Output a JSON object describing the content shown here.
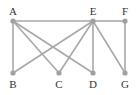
{
  "graph": {
    "nodes": [
      {
        "id": "A",
        "label": "A",
        "x": 13,
        "y": 21,
        "lx": 13,
        "ly": 15
      },
      {
        "id": "E",
        "label": "E",
        "x": 93,
        "y": 21,
        "lx": 93,
        "ly": 15
      },
      {
        "id": "F",
        "label": "F",
        "x": 125,
        "y": 21,
        "lx": 125,
        "ly": 15
      },
      {
        "id": "B",
        "label": "B",
        "x": 13,
        "y": 73,
        "lx": 13,
        "ly": 88
      },
      {
        "id": "C",
        "label": "C",
        "x": 59,
        "y": 73,
        "lx": 59,
        "ly": 88
      },
      {
        "id": "D",
        "label": "D",
        "x": 93,
        "y": 73,
        "lx": 93,
        "ly": 88
      },
      {
        "id": "G",
        "label": "G",
        "x": 125,
        "y": 73,
        "lx": 125,
        "ly": 88
      }
    ],
    "edges": [
      [
        "A",
        "E"
      ],
      [
        "E",
        "F"
      ],
      [
        "A",
        "B"
      ],
      [
        "A",
        "C"
      ],
      [
        "A",
        "D"
      ],
      [
        "E",
        "B"
      ],
      [
        "E",
        "C"
      ],
      [
        "E",
        "D"
      ],
      [
        "E",
        "G"
      ],
      [
        "F",
        "G"
      ]
    ],
    "colors": {
      "edge": "#a8a8a8",
      "node": "#a0a0a0",
      "label": "#333333"
    }
  }
}
